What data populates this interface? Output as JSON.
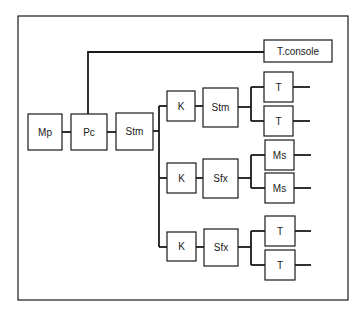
{
  "diagram": {
    "type": "block-diagram",
    "frame": {
      "x": 18,
      "y": 16,
      "w": 330,
      "h": 284
    },
    "colors": {
      "stroke": "#1a1a1a",
      "background": "#ffffff",
      "text": "#1a1a1a"
    },
    "nodes": [
      {
        "id": "mp",
        "label": "Mp",
        "x": 28,
        "y": 114,
        "w": 34,
        "h": 36
      },
      {
        "id": "pc",
        "label": "Pc",
        "x": 71,
        "y": 114,
        "w": 36,
        "h": 36
      },
      {
        "id": "stm-main",
        "label": "Stm",
        "x": 116,
        "y": 113,
        "w": 37,
        "h": 37
      },
      {
        "id": "tconsole",
        "label": "T.console",
        "x": 264,
        "y": 40,
        "w": 68,
        "h": 22
      },
      {
        "id": "k1",
        "label": "K",
        "x": 167,
        "y": 91,
        "w": 28,
        "h": 30
      },
      {
        "id": "stm-1",
        "label": "Stm",
        "x": 203,
        "y": 88,
        "w": 35,
        "h": 39
      },
      {
        "id": "t1a",
        "label": "T",
        "x": 264,
        "y": 72,
        "w": 29,
        "h": 30
      },
      {
        "id": "t1b",
        "label": "T",
        "x": 264,
        "y": 106,
        "w": 29,
        "h": 30
      },
      {
        "id": "k2",
        "label": "K",
        "x": 167,
        "y": 163,
        "w": 29,
        "h": 30
      },
      {
        "id": "sfx-1",
        "label": "Sfx",
        "x": 203,
        "y": 159,
        "w": 35,
        "h": 39
      },
      {
        "id": "ms-a",
        "label": "Ms",
        "x": 265,
        "y": 140,
        "w": 29,
        "h": 30
      },
      {
        "id": "ms-b",
        "label": "Ms",
        "x": 265,
        "y": 173,
        "w": 29,
        "h": 30
      },
      {
        "id": "k3",
        "label": "K",
        "x": 167,
        "y": 232,
        "w": 29,
        "h": 29
      },
      {
        "id": "sfx-2",
        "label": "Sfx",
        "x": 204,
        "y": 229,
        "w": 34,
        "h": 37
      },
      {
        "id": "t3a",
        "label": "T",
        "x": 265,
        "y": 216,
        "w": 30,
        "h": 30
      },
      {
        "id": "t3b",
        "label": "T",
        "x": 265,
        "y": 250,
        "w": 30,
        "h": 30
      }
    ],
    "lines": [
      {
        "d": "M62 132 H71"
      },
      {
        "d": "M107 132 H116"
      },
      {
        "d": "M88 114 V52 H264"
      },
      {
        "d": "M153 131 H159"
      },
      {
        "d": "M159 106 V247"
      },
      {
        "d": "M159 106 H167"
      },
      {
        "d": "M159 178 H167"
      },
      {
        "d": "M159 247 H167"
      },
      {
        "d": "M195 106 H203"
      },
      {
        "d": "M196 178 H203"
      },
      {
        "d": "M196 247 H204"
      },
      {
        "d": "M238 107 H251"
      },
      {
        "d": "M251 87 V121"
      },
      {
        "d": "M251 87 H264"
      },
      {
        "d": "M251 121 H264"
      },
      {
        "d": "M238 178 H251"
      },
      {
        "d": "M251 155 V188"
      },
      {
        "d": "M251 155 H265"
      },
      {
        "d": "M251 188 H265"
      },
      {
        "d": "M238 247 H251"
      },
      {
        "d": "M251 231 V265"
      },
      {
        "d": "M251 231 H265"
      },
      {
        "d": "M251 265 H265"
      },
      {
        "d": "M293 87 H310"
      },
      {
        "d": "M293 121 H310"
      },
      {
        "d": "M294 155 H311"
      },
      {
        "d": "M294 188 H311"
      },
      {
        "d": "M295 231 H311"
      },
      {
        "d": "M295 265 H311"
      }
    ]
  }
}
